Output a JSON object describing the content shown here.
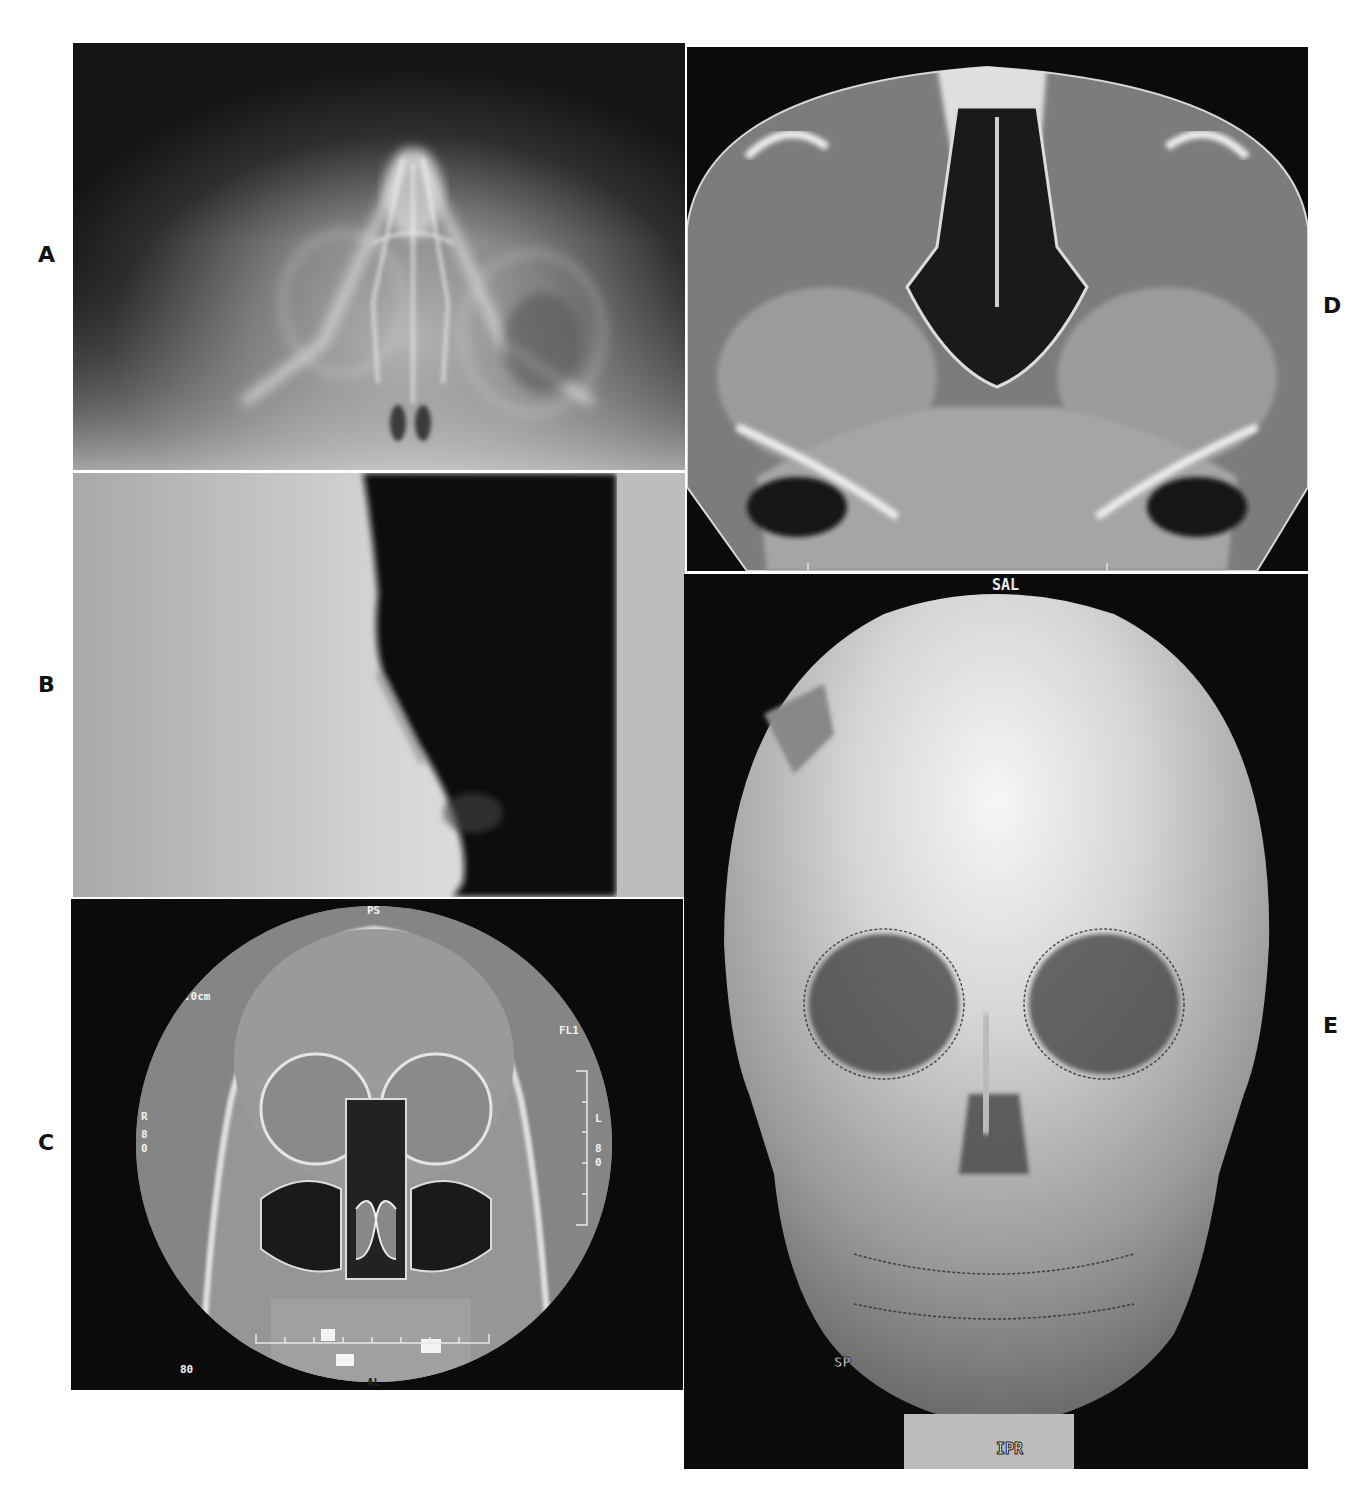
{
  "figure": {
    "panels": [
      {
        "id": "A",
        "label": "A",
        "description": "Frontal plain radiograph of nasal/facial bones (Waters view)"
      },
      {
        "id": "B",
        "label": "B",
        "description": "Lateral soft-tissue radiograph of nose"
      },
      {
        "id": "C",
        "label": "C",
        "description": "Coronal CT of paranasal sinuses and orbits",
        "overlays": {
          "top": "PS",
          "left_scale": ".0cm",
          "right_top": "FL1",
          "left_side": [
            "R",
            "8",
            "0"
          ],
          "right_side": [
            "L",
            "8",
            "0"
          ],
          "bottom_left": "80",
          "bottom": "AL"
        }
      },
      {
        "id": "D",
        "label": "D",
        "description": "Axial CT at level of nasal cavity and maxillary sinuses"
      },
      {
        "id": "E",
        "label": "E",
        "description": "3D CT surface reconstruction of skull, frontal view",
        "overlays": {
          "top": "SAL",
          "bottom": "IPR",
          "lower_left": "SP"
        }
      }
    ]
  },
  "colors": {
    "background": "#ffffff",
    "panel_bg": "#0b0b0b",
    "divider": "#e8e8e8",
    "label": "#111111"
  }
}
